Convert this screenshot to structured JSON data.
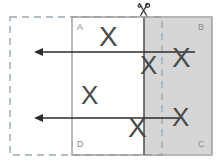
{
  "diagram": {
    "canvas": {
      "width": 224,
      "height": 162,
      "background": "#ffffff"
    },
    "colors": {
      "solid_outline": "#9a9a9a",
      "dashed_outline": "#9aa8b5",
      "shaded_fill": "#d6d6d6",
      "divider_line": "#555555",
      "arrow": "#2b2b2b",
      "x_mark": "#4a4a4a",
      "corner_label": "#8a8a8a"
    },
    "dashed_rect": {
      "name": "dashed-target-rectangle",
      "x": 10,
      "y": 17,
      "width": 152,
      "height": 138,
      "dash_pattern": "7 5",
      "stroke": "#9aa8b5"
    },
    "solid_rect": {
      "name": "solid-source-rectangle",
      "x": 72,
      "y": 17,
      "width": 140,
      "height": 138,
      "stroke": "#9a9a9a"
    },
    "shaded_region": {
      "name": "shaded-cut-region",
      "x": 144,
      "y": 18,
      "width": 68,
      "height": 136,
      "fill": "#d6d6d6"
    },
    "divider": {
      "name": "cut-line",
      "x": 144,
      "y_top": 18,
      "y_bottom": 155,
      "stroke": "#555555",
      "stroke_width": 1.6
    },
    "scissors": {
      "name": "scissors-icon",
      "x": 138,
      "y": 2,
      "label": "scissors"
    },
    "corner_labels": [
      {
        "name": "corner-label-a",
        "text": "A",
        "x": 77,
        "y": 23
      },
      {
        "name": "corner-label-b",
        "text": "B",
        "x": 198,
        "y": 23
      },
      {
        "name": "corner-label-c",
        "text": "C",
        "x": 198,
        "y": 140
      },
      {
        "name": "corner-label-d",
        "text": "D",
        "x": 77,
        "y": 140
      }
    ],
    "arrows": [
      {
        "name": "arrow-upper",
        "x_start": 195,
        "x_end": 34,
        "y": 52
      },
      {
        "name": "arrow-lower",
        "x_start": 180,
        "x_end": 34,
        "y": 118
      }
    ],
    "x_marks": [
      {
        "name": "x-mark-top-left",
        "text": "X",
        "x": 99,
        "y": 23,
        "size": 28
      },
      {
        "name": "x-mark-on-cut-upper",
        "text": "X",
        "x": 140,
        "y": 52,
        "size": 26
      },
      {
        "name": "x-mark-shaded-upper",
        "text": "X",
        "x": 172,
        "y": 44,
        "size": 28
      },
      {
        "name": "x-mark-middle-left",
        "text": "X",
        "x": 81,
        "y": 82,
        "size": 26
      },
      {
        "name": "x-mark-shaded-lower",
        "text": "X",
        "x": 172,
        "y": 104,
        "size": 26
      },
      {
        "name": "x-mark-on-cut-lower",
        "text": "X",
        "x": 128,
        "y": 114,
        "size": 28
      }
    ]
  }
}
